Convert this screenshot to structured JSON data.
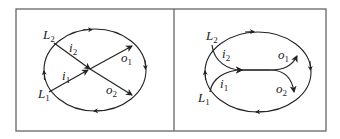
{
  "figure": {
    "panels": [
      {
        "id": "left",
        "description": "Crossing interchange: two inbound branches cross to outbound branches through a single junction point",
        "labels": {
          "L1": {
            "base": "L",
            "sub": "1"
          },
          "L2": {
            "base": "L",
            "sub": "2"
          },
          "i1": {
            "base": "i",
            "sub": "1"
          },
          "i2": {
            "base": "i",
            "sub": "2"
          },
          "o1": {
            "base": "o",
            "sub": "1"
          },
          "o2": {
            "base": "o",
            "sub": "2"
          }
        }
      },
      {
        "id": "right",
        "description": "Merging interchange: two inbound branches merge into a shared segment, then split into outbound branches",
        "labels": {
          "L1": {
            "base": "L",
            "sub": "1"
          },
          "L2": {
            "base": "L",
            "sub": "2"
          },
          "i1": {
            "base": "i",
            "sub": "1"
          },
          "i2": {
            "base": "i",
            "sub": "2"
          },
          "o1": {
            "base": "o",
            "sub": "1"
          },
          "o2": {
            "base": "o",
            "sub": "2"
          }
        }
      }
    ],
    "colors": {
      "stroke": "#222222",
      "frame": "#666666",
      "background": "#ffffff"
    }
  }
}
